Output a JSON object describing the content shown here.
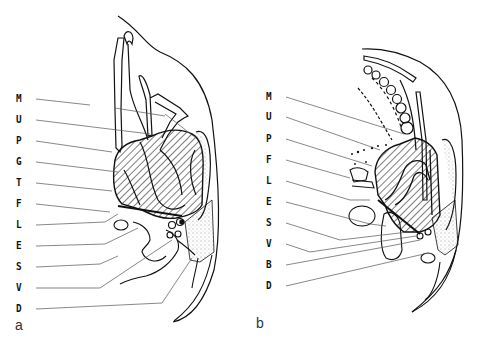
{
  "figure": {
    "panels": [
      {
        "id": "a",
        "caption": "a",
        "labels": [
          "M",
          "U",
          "P",
          "G",
          "T",
          "F",
          "L",
          "E",
          "S",
          "V",
          "D"
        ]
      },
      {
        "id": "b",
        "caption": "b",
        "labels": [
          "M",
          "U",
          "P",
          "F",
          "L",
          "E",
          "S",
          "V",
          "B",
          "D"
        ]
      }
    ]
  },
  "colors": {
    "ink": "#111111",
    "leader": "#555555",
    "stipple": "#bbbbbb",
    "background": "#ffffff"
  }
}
